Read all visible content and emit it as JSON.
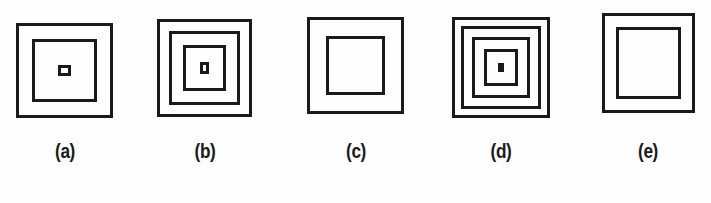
{
  "plate": {
    "background_color": "#fdfdfd",
    "stroke_color": "#1a1a1a",
    "label_color": "#1a1a1a",
    "width": 711,
    "height": 203
  },
  "figures": [
    {
      "id": "figure-a",
      "label": "(a)",
      "icon_name": "nested-squares-3",
      "ring_count": 3,
      "x": 16,
      "y": 23,
      "width": 97,
      "height": 95,
      "stroke": 3,
      "gaps": [
        13,
        23
      ],
      "label_x": 38,
      "label_y": 140,
      "label_width": 54
    },
    {
      "id": "figure-b",
      "label": "(b)",
      "icon_name": "nested-squares-4",
      "ring_count": 4,
      "x": 157,
      "y": 19,
      "width": 95,
      "height": 98,
      "stroke": 3,
      "gaps": [
        9,
        11,
        14
      ],
      "label_x": 178,
      "label_y": 140,
      "label_width": 54
    },
    {
      "id": "figure-c",
      "label": "(c)",
      "icon_name": "nested-squares-3",
      "ring_count": 3,
      "x": 307,
      "y": 17,
      "width": 97,
      "height": 97,
      "stroke": 3,
      "gaps": [
        16,
        25
      ],
      "label_x": 329,
      "label_y": 140,
      "label_width": 54
    },
    {
      "id": "figure-d",
      "label": "(d)",
      "icon_name": "nested-squares-5",
      "ring_count": 5,
      "x": 452,
      "y": 17,
      "width": 98,
      "height": 101,
      "stroke": 3,
      "gaps": [
        6,
        8,
        9,
        11
      ],
      "label_x": 474,
      "label_y": 140,
      "label_width": 54
    },
    {
      "id": "figure-e",
      "label": "(e)",
      "icon_name": "nested-squares-3",
      "ring_count": 3,
      "x": 602,
      "y": 13,
      "width": 93,
      "height": 100,
      "stroke": 3,
      "gaps": [
        11,
        29
      ],
      "label_x": 621,
      "label_y": 140,
      "label_width": 54
    }
  ]
}
